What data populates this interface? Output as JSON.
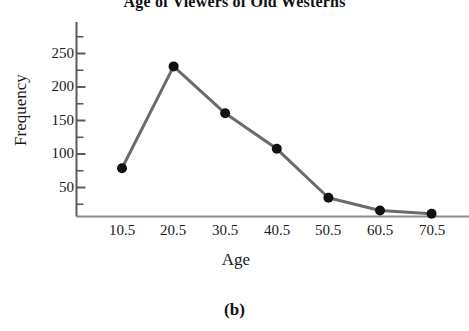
{
  "chart_data": {
    "type": "line",
    "title": "Age of Viewers of Old Westerns",
    "xlabel": "Age",
    "ylabel": "Frequency",
    "caption": "(b)",
    "categories": [
      "10.5",
      "20.5",
      "30.5",
      "40.5",
      "50.5",
      "60.5",
      "70.5"
    ],
    "x": [
      10.5,
      20.5,
      30.5,
      40.5,
      50.5,
      60.5,
      70.5
    ],
    "values": [
      78,
      230,
      160,
      107,
      34,
      15,
      10
    ],
    "series": [
      {
        "name": "Frequency",
        "values": [
          78,
          230,
          160,
          107,
          34,
          15,
          10
        ]
      }
    ],
    "ylim": [
      0,
      285
    ],
    "yticks": [
      50,
      100,
      150,
      200,
      250
    ],
    "ytick_labels": [
      "50",
      "100",
      "150",
      "200",
      "250"
    ],
    "minor_yticks": [
      25,
      75,
      125,
      175,
      225,
      275
    ],
    "xtick_labels": [
      "10.5",
      "20.5",
      "30.5",
      "40.5",
      "50.5",
      "60.5",
      "70.5"
    ],
    "grid": false,
    "legend": null,
    "line_color": "#6b6b6b",
    "marker_color": "#111111",
    "axis_color": "#5a5a5a"
  },
  "axes": {
    "y_ticks": [
      {
        "label": "250",
        "value": 250
      },
      {
        "label": "200",
        "value": 200
      },
      {
        "label": "150",
        "value": 150
      },
      {
        "label": "100",
        "value": 100
      },
      {
        "label": "50",
        "value": 50
      }
    ],
    "x_ticks": [
      {
        "label": "10.5",
        "value": 10.5
      },
      {
        "label": "20.5",
        "value": 20.5
      },
      {
        "label": "30.5",
        "value": 30.5
      },
      {
        "label": "40.5",
        "value": 40.5
      },
      {
        "label": "50.5",
        "value": 50.5
      },
      {
        "label": "60.5",
        "value": 60.5
      },
      {
        "label": "70.5",
        "value": 70.5
      }
    ]
  }
}
